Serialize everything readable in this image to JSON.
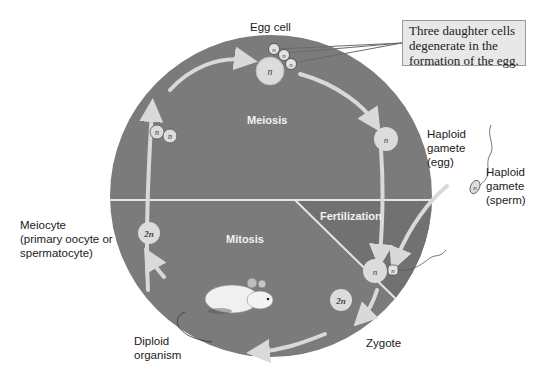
{
  "diagram": {
    "colors": {
      "circle_fill": "#7b7b7b",
      "arrow": "#d9d9d9",
      "cell_fill": "#dcdcdc",
      "divider": "#e6e6e6",
      "text": "#1a1a1a",
      "callout_bg": "#e8e8e8"
    },
    "phases": {
      "meiosis": "Meiosis",
      "fertilization": "Fertilization",
      "mitosis": "Mitosis"
    },
    "labels": {
      "egg_cell": "Egg cell",
      "haploid_egg": "Haploid\ngamete\n(egg)",
      "haploid_sperm": "Haploid\ngamete\n(sperm)",
      "meiocyte": "Meiocyte\n(primary oocyte or\nspermatocyte)",
      "diploid_organism": "Diploid\norganism",
      "zygote": "Zygote"
    },
    "callout": "Three daughter cells\ndegenerate in the\nformation of the egg.",
    "cells": {
      "haploid": "n",
      "diploid": "2n"
    }
  }
}
